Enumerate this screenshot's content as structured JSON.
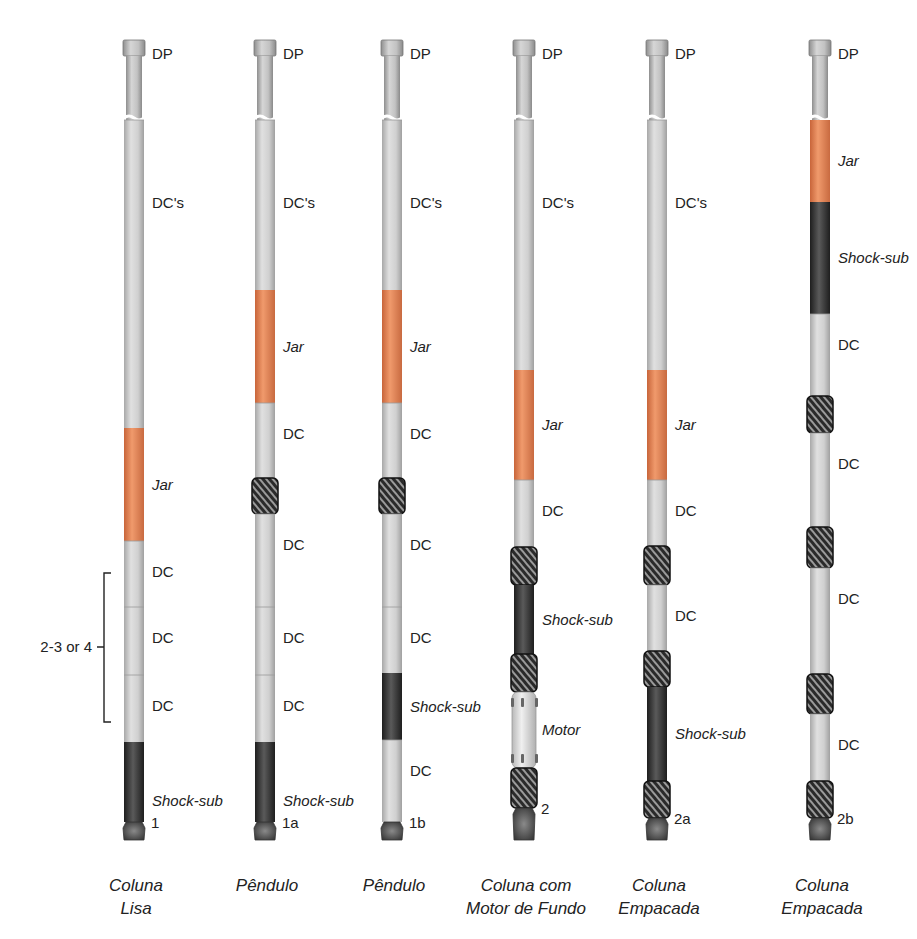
{
  "colors": {
    "pipe": "#c8c8c8",
    "pipe_dark": "#9a9a9a",
    "jar": "#e8895a",
    "shock_sub": "#3a3a3a",
    "stabilizer": "#2e2e2e",
    "motor": "#dcdcdc",
    "bit": "#555555",
    "text": "#222222"
  },
  "bracket": {
    "label": "2-3 or 4"
  },
  "columns": [
    {
      "id": "1",
      "number": "1",
      "caption": [
        "Coluna",
        "Lisa"
      ],
      "segments": [
        {
          "type": "dp",
          "label": "DP"
        },
        {
          "type": "dc",
          "label": "DC's"
        },
        {
          "type": "jar",
          "label": "Jar"
        },
        {
          "type": "dc",
          "label": "DC"
        },
        {
          "type": "dc",
          "label": "DC"
        },
        {
          "type": "dc",
          "label": "DC"
        },
        {
          "type": "shock",
          "label": "Shock-sub"
        },
        {
          "type": "bit",
          "label": ""
        }
      ]
    },
    {
      "id": "1a",
      "number": "1a",
      "caption": [
        "Pêndulo"
      ],
      "segments": [
        {
          "type": "dp",
          "label": "DP"
        },
        {
          "type": "dc",
          "label": "DC's"
        },
        {
          "type": "jar",
          "label": "Jar"
        },
        {
          "type": "dc",
          "label": "DC"
        },
        {
          "type": "stab",
          "label": ""
        },
        {
          "type": "dc",
          "label": "DC"
        },
        {
          "type": "dc",
          "label": "DC"
        },
        {
          "type": "dc",
          "label": "DC"
        },
        {
          "type": "shock",
          "label": "Shock-sub"
        },
        {
          "type": "bit",
          "label": ""
        }
      ]
    },
    {
      "id": "1b",
      "number": "1b",
      "caption": [
        "Pêndulo"
      ],
      "segments": [
        {
          "type": "dp",
          "label": "DP"
        },
        {
          "type": "dc",
          "label": "DC's"
        },
        {
          "type": "jar",
          "label": "Jar"
        },
        {
          "type": "dc",
          "label": "DC"
        },
        {
          "type": "stab",
          "label": ""
        },
        {
          "type": "dc",
          "label": "DC"
        },
        {
          "type": "dc",
          "label": "DC"
        },
        {
          "type": "shock",
          "label": "Shock-sub"
        },
        {
          "type": "dc",
          "label": "DC"
        },
        {
          "type": "bit",
          "label": ""
        }
      ]
    },
    {
      "id": "2",
      "number": "2",
      "caption": [
        "Coluna com",
        "Motor de Fundo"
      ],
      "segments": [
        {
          "type": "dp",
          "label": "DP"
        },
        {
          "type": "dc",
          "label": "DC's"
        },
        {
          "type": "jar",
          "label": "Jar"
        },
        {
          "type": "dc",
          "label": "DC"
        },
        {
          "type": "stab",
          "label": ""
        },
        {
          "type": "shock",
          "label": "Shock-sub"
        },
        {
          "type": "stab",
          "label": ""
        },
        {
          "type": "motor",
          "label": "Motor"
        },
        {
          "type": "stab",
          "label": ""
        },
        {
          "type": "bit",
          "label": ""
        }
      ]
    },
    {
      "id": "2a",
      "number": "2a",
      "caption": [
        "Coluna",
        "Empacada"
      ],
      "segments": [
        {
          "type": "dp",
          "label": "DP"
        },
        {
          "type": "dc",
          "label": "DC's"
        },
        {
          "type": "jar",
          "label": "Jar"
        },
        {
          "type": "dc",
          "label": "DC"
        },
        {
          "type": "stab",
          "label": ""
        },
        {
          "type": "dc",
          "label": "DC"
        },
        {
          "type": "stab",
          "label": ""
        },
        {
          "type": "shock",
          "label": "Shock-sub"
        },
        {
          "type": "stab",
          "label": ""
        },
        {
          "type": "bit",
          "label": ""
        }
      ]
    },
    {
      "id": "2b",
      "number": "2b",
      "caption": [
        "Coluna",
        "Empacada"
      ],
      "segments": [
        {
          "type": "dp",
          "label": "DP"
        },
        {
          "type": "jar",
          "label": "Jar"
        },
        {
          "type": "shock",
          "label": "Shock-sub"
        },
        {
          "type": "dc",
          "label": "DC"
        },
        {
          "type": "stab",
          "label": ""
        },
        {
          "type": "dc",
          "label": "DC"
        },
        {
          "type": "stab",
          "label": ""
        },
        {
          "type": "dc",
          "label": "DC"
        },
        {
          "type": "stab",
          "label": ""
        },
        {
          "type": "dc",
          "label": "DC"
        },
        {
          "type": "stab",
          "label": ""
        },
        {
          "type": "bit",
          "label": ""
        }
      ]
    }
  ]
}
